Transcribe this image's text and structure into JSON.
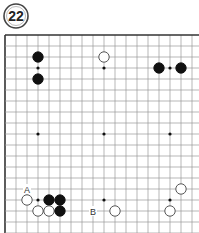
{
  "diagram": {
    "number": "22",
    "board": {
      "origin_x": 5,
      "origin_y": 35,
      "spacing": 11,
      "cols": 18,
      "rows": 18,
      "line_color": "#9a9a9a",
      "edge_color": "#333333",
      "edges": [
        "top",
        "left"
      ]
    },
    "hoshi": [
      [
        3,
        3
      ],
      [
        9,
        3
      ],
      [
        15,
        3
      ],
      [
        3,
        9
      ],
      [
        9,
        9
      ],
      [
        15,
        9
      ],
      [
        3,
        15
      ],
      [
        9,
        15
      ],
      [
        15,
        15
      ]
    ],
    "stones": [
      {
        "color": "black",
        "col": 3,
        "row": 2
      },
      {
        "color": "black",
        "col": 3,
        "row": 4
      },
      {
        "color": "white",
        "col": 9,
        "row": 2
      },
      {
        "color": "black",
        "col": 14,
        "row": 3
      },
      {
        "color": "black",
        "col": 16,
        "row": 3
      },
      {
        "color": "white",
        "col": 2,
        "row": 15
      },
      {
        "color": "black",
        "col": 4,
        "row": 15
      },
      {
        "color": "black",
        "col": 5,
        "row": 15
      },
      {
        "color": "white",
        "col": 3,
        "row": 16
      },
      {
        "color": "white",
        "col": 4,
        "row": 16
      },
      {
        "color": "black",
        "col": 5,
        "row": 16
      },
      {
        "color": "white",
        "col": 10,
        "row": 16
      },
      {
        "color": "white",
        "col": 16,
        "row": 14
      },
      {
        "color": "white",
        "col": 15,
        "row": 16
      }
    ],
    "labels": [
      {
        "text": "A",
        "col": 2,
        "row": 14
      },
      {
        "text": "B",
        "col": 8,
        "row": 16
      }
    ]
  }
}
